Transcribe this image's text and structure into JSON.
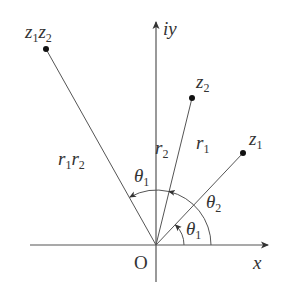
{
  "figure": {
    "colors": {
      "line": "#555555",
      "text": "#333333",
      "background": "#ffffff"
    }
  },
  "axes": {
    "x_label": "x",
    "y_label": "iy",
    "origin_label": "O"
  },
  "points": {
    "z1": {
      "base": "z",
      "sub": "1"
    },
    "z2": {
      "base": "z",
      "sub": "2"
    },
    "z1z2": {
      "base1": "z",
      "sub1": "1",
      "base2": "z",
      "sub2": "2"
    }
  },
  "moduli": {
    "r1": {
      "base": "r",
      "sub": "1"
    },
    "r2": {
      "base": "r",
      "sub": "2"
    },
    "r1r2": {
      "base1": "r",
      "sub1": "1",
      "base2": "r",
      "sub2": "2"
    }
  },
  "angles": {
    "theta1_lower": {
      "base": "θ",
      "sub": "1"
    },
    "theta2": {
      "base": "θ",
      "sub": "2"
    },
    "theta1_upper": {
      "base": "θ",
      "sub": "1"
    }
  }
}
